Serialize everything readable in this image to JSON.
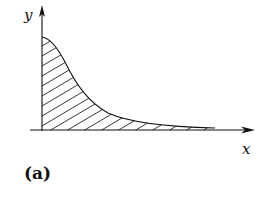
{
  "figure": {
    "x_axis_label": "x",
    "y_axis_label": "y",
    "caption": "(a)",
    "curve": "decaying curve from y-axis toward x-axis",
    "fill": "hatched region under curve",
    "colors": {
      "line": "#111111",
      "background": "#ffffff"
    }
  }
}
